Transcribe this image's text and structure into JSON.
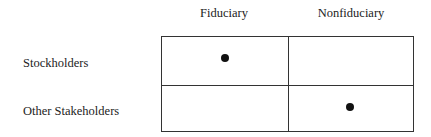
{
  "matrix": {
    "columns": [
      "Fiduciary",
      "Nonfiduciary"
    ],
    "rows": [
      "Stockholders",
      "Other Stakeholders"
    ],
    "marks": [
      {
        "row": "Stockholders",
        "column": "Fiduciary",
        "marked": true
      },
      {
        "row": "Stockholders",
        "column": "Nonfiduciary",
        "marked": false
      },
      {
        "row": "Other Stakeholders",
        "column": "Fiduciary",
        "marked": false
      },
      {
        "row": "Other Stakeholders",
        "column": "Nonfiduciary",
        "marked": true
      }
    ]
  }
}
